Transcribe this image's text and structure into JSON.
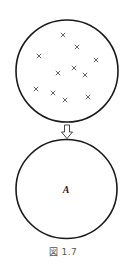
{
  "figure": {
    "caption": "図 1.7",
    "top_circle": {
      "cx": 67,
      "cy": 71,
      "r": 50,
      "marks": [
        {
          "x": 63,
          "y": 35
        },
        {
          "x": 77,
          "y": 47
        },
        {
          "x": 39,
          "y": 56
        },
        {
          "x": 96,
          "y": 60
        },
        {
          "x": 74,
          "y": 68
        },
        {
          "x": 58,
          "y": 73
        },
        {
          "x": 85,
          "y": 75
        },
        {
          "x": 36,
          "y": 89
        },
        {
          "x": 53,
          "y": 93
        },
        {
          "x": 65,
          "y": 100
        },
        {
          "x": 88,
          "y": 97
        }
      ],
      "mark_symbol": "×"
    },
    "arrow": {
      "direction": "down",
      "x": 67,
      "y_top": 125,
      "y_bottom": 139
    },
    "bottom_circle": {
      "cx": 66,
      "cy": 189,
      "r": 50,
      "label": "A"
    },
    "colors": {
      "stroke": "#1a1a1a",
      "mark": "#555555",
      "caption": "#555555"
    }
  }
}
